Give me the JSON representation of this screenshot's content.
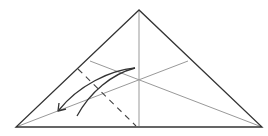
{
  "diagram": {
    "type": "origami-fold-step",
    "colors": {
      "background": "#ffffff",
      "outline": "#333333",
      "crease": "#999999",
      "valley_fold": "#444444",
      "arrow": "#333333"
    }
  }
}
